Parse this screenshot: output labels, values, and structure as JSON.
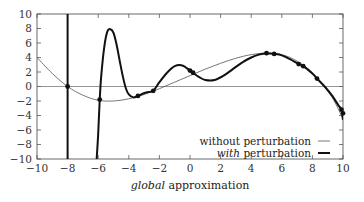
{
  "chart_data": {
    "type": "line",
    "title": "",
    "xlabel": "global approximation",
    "xlabel_parts": [
      {
        "text": "global",
        "italic": true
      },
      {
        "text": " approximation",
        "italic": false
      }
    ],
    "ylabel": "",
    "xlim": [
      -10,
      10
    ],
    "ylim": [
      -10,
      10
    ],
    "x_ticks": [
      -10,
      -8,
      -6,
      -4,
      -2,
      0,
      2,
      4,
      6,
      8,
      10
    ],
    "y_ticks": [
      -10,
      -8,
      -6,
      -4,
      -2,
      0,
      2,
      4,
      6,
      8,
      10
    ],
    "x_tick_labels": [
      "−10",
      "−8",
      "−6",
      "−4",
      "−2",
      "0",
      "2",
      "4",
      "6",
      "8",
      "10"
    ],
    "y_tick_labels": [
      "−10",
      "−8",
      "−6",
      "−4",
      "−2",
      "0",
      "2",
      "4",
      "6",
      "8",
      "10"
    ],
    "grid": false,
    "zero_line": true,
    "legend_position": "lower right",
    "series": [
      {
        "name": "without perturbation",
        "legend_parts": [
          {
            "text": "without perturbation",
            "italic": false
          }
        ],
        "style": "thin",
        "color": "#555555",
        "x": [
          -10,
          -9,
          -8,
          -7,
          -6,
          -5,
          -4,
          -3,
          -2,
          -1,
          0,
          1,
          2,
          3,
          4,
          5,
          6,
          7,
          8,
          9,
          9.5,
          10
        ],
        "y": [
          4.0,
          1.8,
          0.0,
          -1.2,
          -1.9,
          -2.0,
          -1.7,
          -1.1,
          -0.3,
          0.6,
          1.5,
          2.4,
          3.2,
          3.9,
          4.4,
          4.6,
          4.4,
          3.5,
          1.9,
          -0.6,
          -2.3,
          -4.5
        ]
      },
      {
        "name": "with perturbation",
        "legend_parts": [
          {
            "text": "with",
            "italic": true
          },
          {
            "text": " perturbation",
            "italic": false
          }
        ],
        "style": "thick",
        "color": "#111111",
        "segments": [
          {
            "x": [
              -8.0,
              -8.0
            ],
            "y": [
              -10,
              10
            ]
          },
          {
            "x": [
              -6.1,
              -6.0,
              -5.9,
              -5.8,
              -5.6,
              -5.4,
              -5.2,
              -5.0,
              -4.8,
              -4.6,
              -4.4,
              -4.2,
              -4.0,
              -3.7,
              -3.4,
              -3.1,
              -2.8,
              -2.4,
              -2.0,
              -1.5,
              -1.0,
              -0.5,
              0.0,
              0.2,
              0.6,
              1.0,
              1.6,
              2.2,
              2.8,
              3.4,
              4.0,
              4.5,
              5.0,
              5.5,
              6.0,
              6.5,
              7.1,
              7.4,
              8.0,
              8.3,
              8.8,
              9.3,
              9.7,
              9.9,
              10.0
            ],
            "y": [
              -10,
              -6.5,
              -1.8,
              1.5,
              5.5,
              7.6,
              7.9,
              7.4,
              5.8,
              3.6,
              1.5,
              -0.2,
              -1.1,
              -1.5,
              -1.3,
              -1.0,
              -0.8,
              -0.6,
              0.6,
              1.9,
              2.8,
              2.9,
              2.2,
              1.9,
              1.3,
              0.9,
              0.9,
              1.5,
              2.4,
              3.3,
              4.0,
              4.4,
              4.6,
              4.5,
              4.3,
              3.8,
              3.1,
              2.8,
              1.8,
              1.1,
              0.0,
              -1.3,
              -2.6,
              -3.2,
              -4.6
            ]
          }
        ],
        "markers": [
          {
            "x": -8.0,
            "y": 0.0
          },
          {
            "x": -5.9,
            "y": -1.8
          },
          {
            "x": -3.4,
            "y": -1.3
          },
          {
            "x": -2.4,
            "y": -0.6
          },
          {
            "x": 0.0,
            "y": 2.2
          },
          {
            "x": 0.2,
            "y": 1.9
          },
          {
            "x": 5.0,
            "y": 4.6
          },
          {
            "x": 5.5,
            "y": 4.5
          },
          {
            "x": 7.1,
            "y": 3.1
          },
          {
            "x": 7.4,
            "y": 2.8
          },
          {
            "x": 8.3,
            "y": 1.1
          },
          {
            "x": 9.9,
            "y": -3.2
          },
          {
            "x": 10.0,
            "y": -3.7
          }
        ]
      }
    ]
  },
  "layout": {
    "plot_left": 37,
    "plot_right": 343,
    "plot_top": 14,
    "plot_bottom": 159
  }
}
